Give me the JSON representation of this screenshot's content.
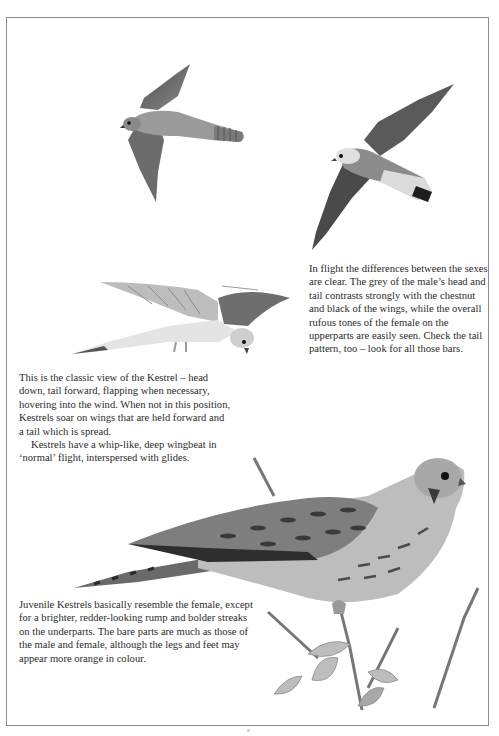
{
  "page": {
    "frame_color": "#8c8c8c",
    "background": "#ffffff"
  },
  "illustrations": [
    {
      "id": "female-kestrel-flight",
      "description": "Female Kestrel in flight, brown barred upperparts and barred tail"
    },
    {
      "id": "male-kestrel-flight",
      "description": "Male Kestrel in flight, grey head and grey tail with black terminal band, chestnut wings"
    },
    {
      "id": "kestrel-hovering",
      "description": "Kestrel hovering, head down, tail forward"
    },
    {
      "id": "juvenile-kestrel-perched",
      "description": "Juvenile Kestrel perched on a twig with leaves"
    }
  ],
  "captions": {
    "flight_sexes": {
      "paragraphs": [
        "In flight the differences between the sexes are clear. The grey of the male’s head and tail contrasts strongly with the chestnut and black of the wings, while the overall rufous tones of the female on the upperparts are easily seen. Check the tail pattern, too – look for all those bars."
      ]
    },
    "hovering": {
      "paragraphs": [
        "This is the classic view of the Kestrel – head down, tail forward, flapping when necessary, hovering into the wind. When not in this position, Kestrels soar on wings that are held forward and a tail which is spread.",
        "Kestrels have a whip-like, deep wingbeat in ‘normal’ flight, interspersed with glides."
      ]
    },
    "juvenile": {
      "paragraphs": [
        "Juvenile Kestrels basically resemble the female, except for a brighter, redder-looking rump and bolder streaks on the underparts. The bare parts are much as those of the male and female, although the legs and feet may appear more orange in colour."
      ]
    }
  }
}
